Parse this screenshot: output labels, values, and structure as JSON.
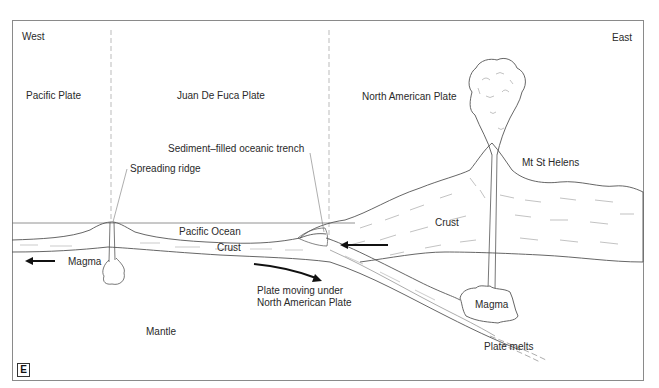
{
  "figure": {
    "panel_tag": "E",
    "directions": {
      "west": "West",
      "east": "East"
    },
    "plates": {
      "pacific": "Pacific Plate",
      "juan_de_fuca": "Juan De Fuca Plate",
      "north_american": "North American Plate"
    },
    "labels": {
      "trench": "Sediment–filled oceanic trench",
      "ridge": "Spreading ridge",
      "volcano": "Mt St Helens",
      "ocean": "Pacific Ocean",
      "oceanic_crust": "Crust",
      "continental_crust": "Crust",
      "ridge_magma": "Magma",
      "subduction_line1": "Plate moving under",
      "subduction_line2": "North American Plate",
      "mantle": "Mantle",
      "arc_magma": "Magma",
      "plate_melts": "Plate melts"
    },
    "colors": {
      "line": "#555555",
      "arrow": "#111111",
      "dash": "#999999",
      "background": "#ffffff"
    }
  }
}
